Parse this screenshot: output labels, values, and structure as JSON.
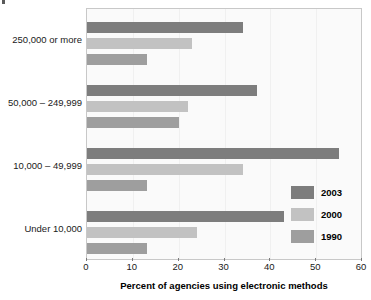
{
  "chart_data": {
    "type": "bar",
    "orientation": "horizontal",
    "title": "",
    "xlabel": "Percent of agencies using electronic methods",
    "ylabel": "",
    "xlim": [
      0,
      60
    ],
    "xticks": [
      0,
      10,
      20,
      30,
      40,
      50,
      60
    ],
    "grid": true,
    "legend_position": "inside-bottom-right",
    "categories": [
      "250,000 or more",
      "50,000 – 249,999",
      "10,000 – 49,999",
      "Under 10,000"
    ],
    "series": [
      {
        "name": "2003",
        "color": "#7d7d7d",
        "values": [
          34,
          37,
          55,
          43
        ]
      },
      {
        "name": "2000",
        "color": "#c2c2c2",
        "values": [
          23,
          22,
          34,
          24
        ]
      },
      {
        "name": "1990",
        "color": "#9e9e9e",
        "values": [
          13,
          20,
          13,
          13
        ]
      }
    ]
  },
  "axis": {
    "tick_labels": [
      "0",
      "10",
      "20",
      "30",
      "40",
      "50",
      "60"
    ],
    "title": "Percent of agencies using electronic methods"
  },
  "legend": {
    "items": [
      {
        "label": "2003",
        "color": "#7d7d7d"
      },
      {
        "label": "2000",
        "color": "#c2c2c2"
      },
      {
        "label": "1990",
        "color": "#9e9e9e"
      }
    ]
  }
}
